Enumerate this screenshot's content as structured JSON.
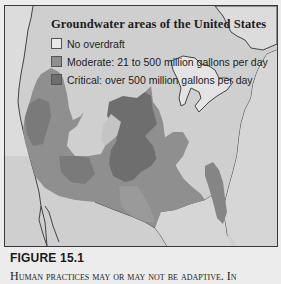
{
  "map": {
    "title": "Groundwater areas of the United States",
    "legend": [
      {
        "label": "No overdraft",
        "color": "#e8e8e8"
      },
      {
        "label": "Moderate: 21 to 500 million gallons per day",
        "color": "#8f8f8f"
      },
      {
        "label": "Critical: over 500 million gallons per day",
        "color": "#6e6e6e"
      }
    ],
    "colors": {
      "land": "#cfcfcf",
      "water": "#e4e4e4",
      "moderate": "#8f8f8f",
      "critical": "#6e6e6e",
      "border": "#3a3a3a"
    }
  },
  "caption": {
    "figure_label": "FIGURE 15.1",
    "text": "Human practices may or may not be adaptive. In"
  }
}
